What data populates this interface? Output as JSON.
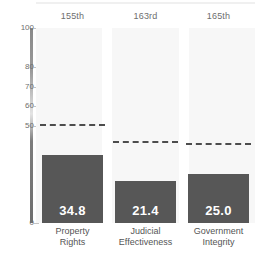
{
  "chart_data": {
    "type": "bar",
    "title": "",
    "subtitle": "",
    "xlabel": "",
    "ylabel": "",
    "ylim": [
      0,
      100
    ],
    "grid": false,
    "legend_position": "none",
    "categories": [
      "Property Rights",
      "Judicial Effectiveness",
      "Government Integrity"
    ],
    "category_lines": [
      [
        "Property",
        "Rights"
      ],
      [
        "Judicial",
        "Effectiveness"
      ],
      [
        "Government",
        "Integrity"
      ]
    ],
    "values": [
      34.8,
      21.4,
      25.0
    ],
    "value_labels": [
      "34.8",
      "21.4",
      "25.0"
    ],
    "rank_labels": [
      "155th",
      "163rd",
      "165th"
    ],
    "reference_lines": {
      "label": "world average",
      "values": [
        50.0,
        41.0,
        40.0
      ],
      "style": "dashed"
    },
    "y_ticks": [
      {
        "value": 100,
        "label": "100"
      },
      {
        "value": 80,
        "label": "80"
      },
      {
        "value": 70,
        "label": "70"
      },
      {
        "value": 60,
        "label": "60"
      },
      {
        "value": 50,
        "label": "50"
      },
      {
        "value": 0,
        "label": "0"
      }
    ],
    "colors": {
      "bar": "#575757",
      "column_band": "#f7f7f7",
      "reference_line": "#4d4d4d",
      "value_text": "#ffffff",
      "axis_text": "#6e6e6e",
      "category_text": "#555555",
      "background": "#ffffff"
    }
  }
}
